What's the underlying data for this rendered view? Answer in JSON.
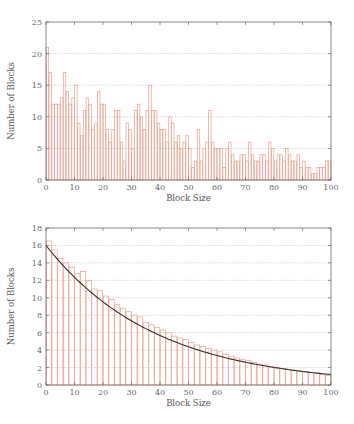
{
  "chart_data": [
    {
      "type": "bar",
      "title": "",
      "xlabel": "Block Size",
      "ylabel": "Number of Blocks",
      "xlim": [
        0,
        100
      ],
      "ylim": [
        0,
        25
      ],
      "xticks": [
        0,
        10,
        20,
        30,
        40,
        50,
        60,
        70,
        80,
        90,
        100
      ],
      "yticks": [
        0,
        5,
        10,
        15,
        20,
        25
      ],
      "grid": "horizontal dotted",
      "bar_color": "#e8a090",
      "x": [
        0,
        1,
        2,
        3,
        4,
        5,
        6,
        7,
        8,
        9,
        10,
        11,
        12,
        13,
        14,
        15,
        16,
        17,
        18,
        19,
        20,
        21,
        22,
        23,
        24,
        25,
        26,
        27,
        28,
        29,
        30,
        31,
        32,
        33,
        34,
        35,
        36,
        37,
        38,
        39,
        40,
        41,
        42,
        43,
        44,
        45,
        46,
        47,
        48,
        49,
        50,
        51,
        52,
        53,
        54,
        55,
        56,
        57,
        58,
        59,
        60,
        61,
        62,
        63,
        64,
        65,
        66,
        67,
        68,
        69,
        70,
        71,
        72,
        73,
        74,
        75,
        76,
        77,
        78,
        79,
        80,
        81,
        82,
        83,
        84,
        85,
        86,
        87,
        88,
        89,
        90,
        91,
        92,
        93,
        94,
        95,
        96,
        97,
        98,
        99
      ],
      "values": [
        21,
        17,
        12,
        12,
        12,
        13,
        17,
        14,
        12,
        13,
        15,
        9,
        7,
        11,
        13,
        12,
        8,
        9,
        14,
        12,
        12,
        8,
        6,
        8,
        11,
        11,
        6,
        3,
        9,
        8,
        5,
        11,
        12,
        10,
        8,
        11,
        15,
        11,
        11,
        9,
        8,
        8,
        6,
        10,
        9,
        6,
        7,
        5,
        6,
        7,
        5,
        2,
        3,
        8,
        3,
        5,
        6,
        11,
        6,
        5,
        5,
        5,
        2,
        5,
        6,
        4,
        3,
        3,
        4,
        4,
        3,
        6,
        4,
        3,
        3,
        4,
        4,
        3,
        6,
        5,
        3,
        4,
        4,
        3,
        5,
        4,
        3,
        3,
        4,
        2,
        3,
        2,
        2,
        1,
        1,
        2,
        2,
        2,
        3,
        3
      ]
    },
    {
      "type": "bar",
      "title": "",
      "xlabel": "Block Size",
      "ylabel": "Number of Blocks",
      "xlim": [
        0,
        100
      ],
      "ylim": [
        0,
        18
      ],
      "xticks": [
        0,
        10,
        20,
        30,
        40,
        50,
        60,
        70,
        80,
        90,
        100
      ],
      "yticks": [
        0,
        2,
        4,
        6,
        8,
        10,
        12,
        14,
        16,
        18
      ],
      "grid": "horizontal dotted",
      "bar_color": "#e8a090",
      "curve_color": "#3a2a2a",
      "fit_curve": {
        "type": "exponential_decay",
        "y0": 16.0,
        "y100": 1.2
      },
      "x": [
        0,
        2,
        4,
        6,
        8,
        10,
        12,
        14,
        16,
        18,
        20,
        22,
        24,
        26,
        28,
        30,
        32,
        34,
        36,
        38,
        40,
        42,
        44,
        46,
        48,
        50,
        52,
        54,
        56,
        58,
        60,
        62,
        64,
        66,
        68,
        70,
        72,
        74,
        76,
        78,
        80,
        82,
        84,
        86,
        88,
        90,
        92,
        94,
        96,
        98
      ],
      "values": [
        16.5,
        15.5,
        14.5,
        14,
        13.5,
        12.8,
        13,
        12,
        11,
        10.8,
        10.2,
        9.8,
        9.2,
        8.8,
        8.4,
        8,
        7.8,
        7.2,
        6.9,
        6.6,
        6.3,
        6,
        5.6,
        5.4,
        5.2,
        4.9,
        4.6,
        4.4,
        4.2,
        4,
        3.8,
        3.5,
        3.3,
        3.1,
        2.9,
        2.8,
        2.6,
        2.4,
        2.3,
        2.1,
        2,
        1.9,
        1.8,
        1.7,
        1.6,
        1.5,
        1.4,
        1.3,
        1.2,
        1.1
      ]
    }
  ]
}
